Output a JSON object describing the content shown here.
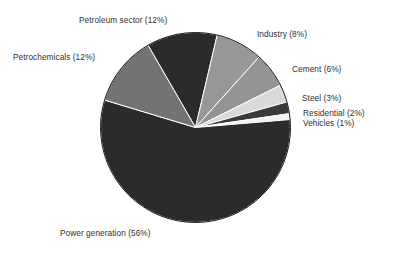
{
  "chart_data": {
    "type": "pie",
    "title": "",
    "subtitle": "",
    "xlabel": "",
    "ylabel": "",
    "legend_position": "none",
    "grid": false,
    "labels_position": "outside",
    "unit": "%",
    "total": 100,
    "categories": [
      "Petroleum sector",
      "Industry",
      "Cement",
      "Steel",
      "Residential",
      "Vehicles",
      "Power generation",
      "Petrochemicals"
    ],
    "values": [
      12,
      8,
      6,
      3,
      2,
      1,
      56,
      12
    ],
    "slices": [
      {
        "name": "Petroleum sector",
        "value": 12,
        "label": "Petroleum sector (12%)",
        "color": "#2b2b2b"
      },
      {
        "name": "Industry",
        "value": 8,
        "label": "Industry (8%)",
        "color": "#979797"
      },
      {
        "name": "Cement",
        "value": 6,
        "label": "Cement (6%)",
        "color": "#949494"
      },
      {
        "name": "Steel",
        "value": 3,
        "label": "Steel (3%)",
        "color": "#d9d9d9"
      },
      {
        "name": "Residential",
        "value": 2,
        "label": "Residential (2%)",
        "color": "#3a3a3a"
      },
      {
        "name": "Vehicles",
        "value": 1,
        "label": "Vehicles (1%)",
        "color": "#f2f2f2"
      },
      {
        "name": "Power generation",
        "value": 56,
        "label": "Power generation (56%)",
        "color": "#2b2b2b"
      },
      {
        "name": "Petrochemicals",
        "value": 12,
        "label": "Petrochemicals (12%)",
        "color": "#737373"
      }
    ],
    "colors": {
      "outline": "#1a1a1a",
      "separator": "#ffffff",
      "label_text": "#2f2f2f",
      "background": "#ffffff"
    }
  },
  "labels": {
    "petroleum": "Petroleum sector (12%)",
    "petrochemicals": "Petrochemicals (12%)",
    "industry": "Industry (8%)",
    "cement": "Cement (6%)",
    "steel": "Steel (3%)",
    "residential": "Residential (2%)",
    "vehicles": "Vehicles (1%)",
    "power": "Power generation (56%)"
  }
}
